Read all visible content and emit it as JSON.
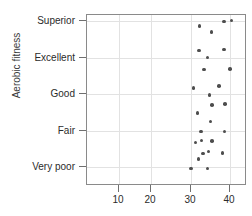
{
  "chart_data": {
    "type": "scatter",
    "title": "",
    "xlabel": "VO2 max (ml/kg/min)",
    "ylabel": "Aerobic fitness",
    "xlim": [
      4,
      44
    ],
    "xticks": [
      10,
      20,
      30,
      40
    ],
    "xticklabels": [
      "10",
      "20",
      "30",
      "40"
    ],
    "categories": [
      "Very poor",
      "Fair",
      "Good",
      "Excellent",
      "Superior"
    ],
    "yticklabels": [
      "Superior",
      "Excellent",
      "Good",
      "Fair",
      "Very poor"
    ],
    "grid": true,
    "legend": "none",
    "marker": "filled-circle",
    "marker_color": "#4d4d4d",
    "points": [
      {
        "x": 29.4,
        "y_px": 167.5
      },
      {
        "x": 33.9,
        "y_px": 167.5
      },
      {
        "x": 31.5,
        "y_px": 158.0
      },
      {
        "x": 32.7,
        "y_px": 152.5
      },
      {
        "x": 34.2,
        "y_px": 150.5
      },
      {
        "x": 38.0,
        "y_px": 152.0
      },
      {
        "x": 30.7,
        "y_px": 141.5
      },
      {
        "x": 32.3,
        "y_px": 139.5
      },
      {
        "x": 35.1,
        "y_px": 140.0
      },
      {
        "x": 38.5,
        "y_px": 130.5
      },
      {
        "x": 32.1,
        "y_px": 130.5
      },
      {
        "x": 34.7,
        "y_px": 120.5
      },
      {
        "x": 31.2,
        "y_px": 112.0
      },
      {
        "x": 35.2,
        "y_px": 104.0
      },
      {
        "x": 38.6,
        "y_px": 103.0
      },
      {
        "x": 34.5,
        "y_px": 94.0
      },
      {
        "x": 30.1,
        "y_px": 87.0
      },
      {
        "x": 37.0,
        "y_px": 85.0
      },
      {
        "x": 33.0,
        "y_px": 68.5
      },
      {
        "x": 40.0,
        "y_px": 68.0
      },
      {
        "x": 33.9,
        "y_px": 56.5
      },
      {
        "x": 31.6,
        "y_px": 49.5
      },
      {
        "x": 38.3,
        "y_px": 48.5
      },
      {
        "x": 35.0,
        "y_px": 31.0
      },
      {
        "x": 31.8,
        "y_px": 25.0
      },
      {
        "x": 38.3,
        "y_px": 20.5
      },
      {
        "x": 40.4,
        "y_px": 19.5
      }
    ]
  },
  "axes": {
    "y_title": "Aerobic fitness",
    "y_labels": [
      {
        "text": "Superior",
        "py": 20
      },
      {
        "text": "Excellent",
        "py": 57
      },
      {
        "text": "Good",
        "py": 93
      },
      {
        "text": "Fair",
        "py": 130
      },
      {
        "text": "Very poor",
        "py": 166
      }
    ],
    "x_labels": [
      {
        "text": "10",
        "px": 118
      },
      {
        "text": "20",
        "px": 150
      },
      {
        "text": "30",
        "px": 190
      },
      {
        "text": "40",
        "px": 229
      }
    ],
    "x_title": ""
  }
}
